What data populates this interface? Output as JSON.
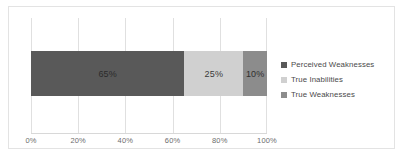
{
  "chart_data": {
    "type": "bar",
    "orientation": "horizontal",
    "stacked": true,
    "title": "",
    "xlabel": "",
    "ylabel": "",
    "xlim": [
      0,
      100
    ],
    "grid": true,
    "legend_position": "right",
    "categories": [
      ""
    ],
    "tick_labels": [
      "0%",
      "20%",
      "40%",
      "60%",
      "80%",
      "100%"
    ],
    "tick_values": [
      0,
      20,
      40,
      60,
      80,
      100
    ],
    "series": [
      {
        "name": "Perceived Weaknesses",
        "values": [
          65
        ],
        "data_label": "65%",
        "color": "#595959"
      },
      {
        "name": "True Inabilities",
        "values": [
          25
        ],
        "data_label": "25%",
        "color": "#d0d0d0"
      },
      {
        "name": "True Weaknesses",
        "values": [
          10
        ],
        "data_label": "10%",
        "color": "#8c8c8c"
      }
    ]
  },
  "legend": {
    "items": [
      {
        "label": "Perceived Weaknesses",
        "color": "#595959"
      },
      {
        "label": "True Inabilities",
        "color": "#d0d0d0"
      },
      {
        "label": "True Weaknesses",
        "color": "#8c8c8c"
      }
    ]
  },
  "colors": {
    "border": "#e3e3e3",
    "gridline": "#e0e0e0",
    "axis_text": "#6d6d6d",
    "legend_text": "#4a4a4a",
    "plot_background": "#ffffff"
  }
}
